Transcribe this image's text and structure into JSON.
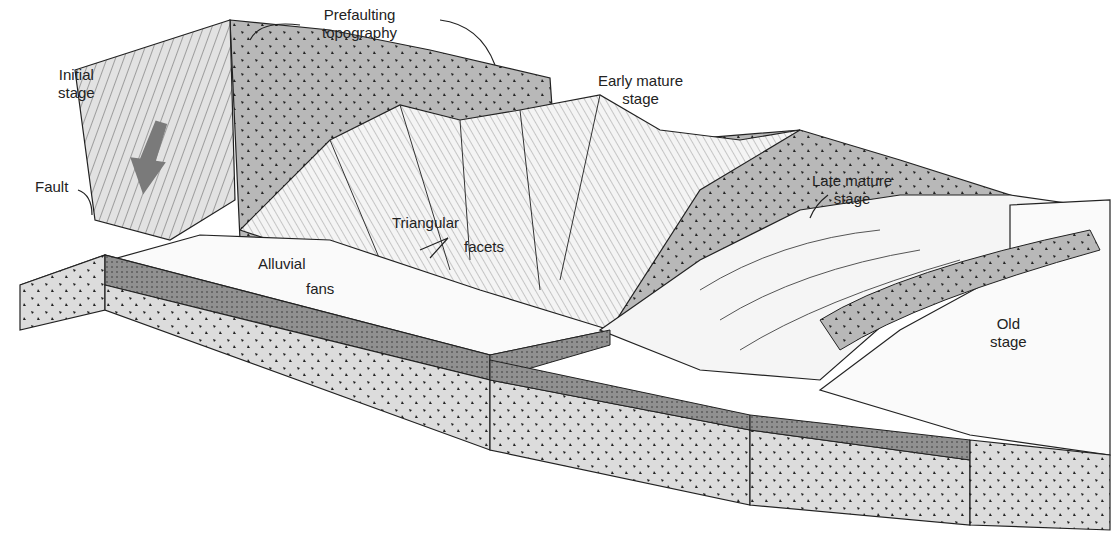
{
  "diagram": {
    "type": "geologic-block-diagram",
    "colors": {
      "rock_gray": "#b8b8b8",
      "dark_layer": "#8f8f8f",
      "line": "#222222",
      "arrow": "#7a7a7a"
    },
    "labels": {
      "prefaulting": [
        "Prefaulting",
        "topography"
      ],
      "initial": [
        "Initial",
        "stage"
      ],
      "early_mature": [
        "Early mature",
        "stage"
      ],
      "late_mature": [
        "Late mature",
        "stage"
      ],
      "old": [
        "Old",
        "stage"
      ],
      "fault": "Fault",
      "triangular": "Triangular",
      "facets": "facets",
      "alluvial": "Alluvial",
      "fans": "fans"
    }
  }
}
